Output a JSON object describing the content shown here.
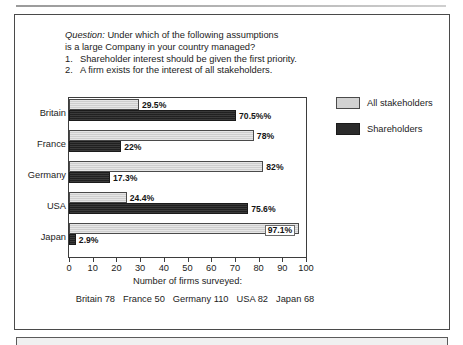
{
  "question": {
    "label": "Question:",
    "line1": " Under which of the following assumptions",
    "line2": "is a large Company in your country managed?",
    "items": [
      {
        "num": "1.",
        "text": "Shareholder interest should be given the first priority."
      },
      {
        "num": "2.",
        "text": "A firm exists for the interest of all stakeholders."
      }
    ]
  },
  "chart_data": {
    "type": "bar",
    "orientation": "horizontal",
    "title": "",
    "xlabel": "Number of firms surveyed:",
    "ylabel": "",
    "xlim": [
      0,
      100
    ],
    "xticks": [
      0,
      10,
      20,
      30,
      40,
      50,
      60,
      70,
      80,
      90,
      100
    ],
    "grid": false,
    "legend_position": "right",
    "categories": [
      "Britain",
      "France",
      "Germany",
      "USA",
      "Japan"
    ],
    "series": [
      {
        "name": "All stakeholders",
        "color": "#d2d2d2",
        "values": [
          29.5,
          78,
          82,
          24.4,
          97.1
        ],
        "labels": [
          "29.5%",
          "78%",
          "82%",
          "24.4%",
          "97.1%"
        ],
        "label_placement": [
          "outside",
          "outside",
          "outside",
          "outside",
          "inside"
        ]
      },
      {
        "name": "Shareholders",
        "color": "#2b2b2b",
        "values": [
          70.5,
          22,
          17.3,
          75.6,
          2.9
        ],
        "labels": [
          "70.5%%",
          "22%",
          "17.3%",
          "75.6%",
          "2.9%"
        ],
        "label_placement": [
          "outside",
          "outside",
          "outside",
          "outside",
          "outside"
        ]
      }
    ]
  },
  "footnote": {
    "entries": [
      "Britain 78",
      "France 50",
      "Germany 110",
      "USA 82",
      "Japan 68"
    ]
  },
  "colors": {
    "all_stakeholders": "#d2d2d2",
    "shareholders": "#2b2b2b",
    "frame": "#4a4a4a"
  }
}
